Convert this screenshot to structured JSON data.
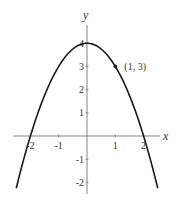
{
  "chart_data": {
    "type": "line",
    "title": "",
    "xlabel": "x",
    "ylabel": "y",
    "function": "y = 4 - x^2",
    "xlim": [
      -2.5,
      2.6
    ],
    "ylim": [
      -2.4,
      4.6
    ],
    "x_ticks": [
      -2,
      -1,
      1,
      2
    ],
    "x_tick_labels": [
      "-2",
      "-1",
      "1",
      "2"
    ],
    "y_ticks": [
      4,
      3,
      2,
      1,
      -1,
      -2
    ],
    "y_tick_labels": [
      "4",
      "3",
      "2",
      "1",
      "-1",
      "-2"
    ],
    "grid": false,
    "series": [
      {
        "name": "parabola",
        "x": [
          -2.5,
          -2,
          -1.5,
          -1,
          -0.5,
          0,
          0.5,
          1,
          1.5,
          2,
          2.5
        ],
        "y": [
          -2.25,
          0,
          1.75,
          3,
          3.75,
          4,
          3.75,
          3,
          1.75,
          0,
          -2.25
        ]
      }
    ],
    "annotations": [
      {
        "x": 1,
        "y": 3,
        "text": "(1, 3)",
        "marker": "dot"
      }
    ]
  },
  "colors": {
    "curve": "#1a1a1a",
    "axis": "#666666",
    "text": "#333333"
  }
}
